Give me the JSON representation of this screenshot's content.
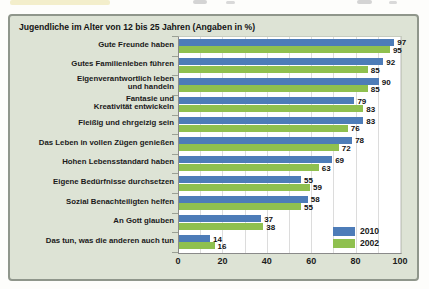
{
  "top_strip": {
    "note_highlight_color": "#f3eecb",
    "fragment_color": "#d4d4d4"
  },
  "panel": {
    "background": "#dde3d5",
    "border_color": "#8f968b"
  },
  "chart_data": {
    "type": "bar",
    "orientation": "horizontal",
    "title": "Jugendliche im Alter von 12 bis 25 Jahren (Angaben in %)",
    "categories": [
      "Gute Freunde haben",
      "Gutes Familienleben führen",
      "Eigenverantwortlich leben\nund handeln",
      "Fantasie und\nKreativität entwickeln",
      "Fleißig und ehrgeizig sein",
      "Das Leben in vollen Zügen genießen",
      "Hohen Lebensstandard haben",
      "Eigene Bedürfnisse durchsetzen",
      "Sozial Benachteiligten helfen",
      "An Gott glauben",
      "Das tun, was die anderen auch tun"
    ],
    "series": [
      {
        "name": "2010",
        "color": "#4d7cb8",
        "values": [
          97,
          92,
          90,
          79,
          83,
          78,
          69,
          55,
          58,
          37,
          14
        ]
      },
      {
        "name": "2002",
        "color": "#8fc04f",
        "values": [
          95,
          85,
          85,
          83,
          76,
          72,
          63,
          59,
          55,
          38,
          16
        ]
      }
    ],
    "xlim": [
      0,
      100
    ],
    "x_ticks": [
      0,
      20,
      40,
      60,
      80,
      100
    ],
    "gridline_interval": 10,
    "grid": true,
    "value_labels": true,
    "legend_position": "bottom-right"
  }
}
